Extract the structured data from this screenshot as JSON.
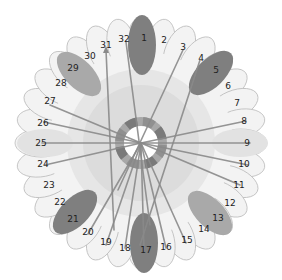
{
  "diagram": {
    "center": {
      "x": 141,
      "y": 143
    },
    "petal_count": 32,
    "petal_radius": 122,
    "colors": {
      "petal_fill": "#f3f3f3",
      "petal_stroke": "#bdbdbd",
      "inner_disk": "#dcdcdc",
      "mid_disk": "#e6e6e6",
      "ring_dark": "#7a7a7a",
      "ring_light": "#a8a8a8",
      "core": "#ffffff",
      "spoke": "#8a8a8a",
      "oval_dark": "#7f7f7f",
      "oval_medium": "#a9a9a9",
      "oval_light": "#e2e2e2"
    },
    "labels": [
      {
        "n": "1",
        "x": 144,
        "y": 38
      },
      {
        "n": "2",
        "x": 164,
        "y": 40
      },
      {
        "n": "3",
        "x": 183,
        "y": 47
      },
      {
        "n": "4",
        "x": 201,
        "y": 58
      },
      {
        "n": "5",
        "x": 216,
        "y": 70
      },
      {
        "n": "6",
        "x": 228,
        "y": 86
      },
      {
        "n": "7",
        "x": 237,
        "y": 103
      },
      {
        "n": "8",
        "x": 244,
        "y": 121
      },
      {
        "n": "9",
        "x": 247,
        "y": 143
      },
      {
        "n": "10",
        "x": 244,
        "y": 164
      },
      {
        "n": "11",
        "x": 239,
        "y": 185
      },
      {
        "n": "12",
        "x": 230,
        "y": 203
      },
      {
        "n": "13",
        "x": 218,
        "y": 218
      },
      {
        "n": "14",
        "x": 204,
        "y": 229
      },
      {
        "n": "15",
        "x": 187,
        "y": 240
      },
      {
        "n": "16",
        "x": 166,
        "y": 247
      },
      {
        "n": "17",
        "x": 146,
        "y": 250
      },
      {
        "n": "18",
        "x": 125,
        "y": 248
      },
      {
        "n": "19",
        "x": 106,
        "y": 242
      },
      {
        "n": "20",
        "x": 88,
        "y": 232
      },
      {
        "n": "21",
        "x": 73,
        "y": 219
      },
      {
        "n": "22",
        "x": 60,
        "y": 202
      },
      {
        "n": "23",
        "x": 49,
        "y": 185
      },
      {
        "n": "24",
        "x": 43,
        "y": 164
      },
      {
        "n": "25",
        "x": 41,
        "y": 143
      },
      {
        "n": "26",
        "x": 43,
        "y": 123
      },
      {
        "n": "27",
        "x": 50,
        "y": 101
      },
      {
        "n": "28",
        "x": 61,
        "y": 83
      },
      {
        "n": "29",
        "x": 73,
        "y": 68
      },
      {
        "n": "30",
        "x": 90,
        "y": 56
      },
      {
        "n": "31",
        "x": 106,
        "y": 45
      },
      {
        "n": "32",
        "x": 124,
        "y": 39
      }
    ],
    "ovals": [
      {
        "petal": "1",
        "cx": 142,
        "cy": 45,
        "rx": 14,
        "ry": 30,
        "angle": 0,
        "tone": "oval_dark"
      },
      {
        "petal": "5",
        "cx": 211,
        "cy": 73,
        "rx": 14,
        "ry": 28,
        "angle": 45,
        "tone": "oval_dark"
      },
      {
        "petal": "9",
        "cx": 240,
        "cy": 143,
        "rx": 14,
        "ry": 28,
        "angle": 90,
        "tone": "oval_light"
      },
      {
        "petal": "13",
        "cx": 210,
        "cy": 213,
        "rx": 14,
        "ry": 28,
        "angle": 135,
        "tone": "oval_medium"
      },
      {
        "petal": "17",
        "cx": 144,
        "cy": 243,
        "rx": 14,
        "ry": 30,
        "angle": 0,
        "tone": "oval_dark"
      },
      {
        "petal": "21",
        "cx": 75,
        "cy": 212,
        "rx": 14,
        "ry": 28,
        "angle": 45,
        "tone": "oval_dark"
      },
      {
        "petal": "25",
        "cx": 45,
        "cy": 143,
        "rx": 14,
        "ry": 28,
        "angle": 90,
        "tone": "oval_light"
      },
      {
        "petal": "29",
        "cx": 79,
        "cy": 74,
        "rx": 14,
        "ry": 28,
        "angle": 135,
        "tone": "oval_medium"
      }
    ],
    "spokes": [
      {
        "to": "31",
        "x1": 114,
        "y1": 230,
        "x2": 106,
        "y2": 50,
        "arrow": true
      },
      {
        "to": "32",
        "x1": 150,
        "y1": 225,
        "x2": 126,
        "y2": 42
      },
      {
        "to": "3",
        "x1": 118,
        "y1": 190,
        "x2": 183,
        "y2": 50
      },
      {
        "to": "4",
        "x1": 140,
        "y1": 245,
        "x2": 200,
        "y2": 60
      },
      {
        "to": "8",
        "x1": 141,
        "y1": 143,
        "x2": 246,
        "y2": 121
      },
      {
        "to": "9",
        "x1": 141,
        "y1": 143,
        "x2": 250,
        "y2": 143
      },
      {
        "to": "10",
        "x1": 141,
        "y1": 143,
        "x2": 248,
        "y2": 165
      },
      {
        "to": "11",
        "x1": 141,
        "y1": 143,
        "x2": 240,
        "y2": 185
      },
      {
        "to": "15",
        "x1": 141,
        "y1": 143,
        "x2": 186,
        "y2": 243
      },
      {
        "to": "16",
        "x1": 141,
        "y1": 143,
        "x2": 166,
        "y2": 248
      },
      {
        "to": "17",
        "x1": 141,
        "y1": 143,
        "x2": 144,
        "y2": 250
      },
      {
        "to": "18",
        "x1": 141,
        "y1": 143,
        "x2": 125,
        "y2": 248
      },
      {
        "to": "19",
        "x1": 141,
        "y1": 143,
        "x2": 106,
        "y2": 245
      },
      {
        "to": "20",
        "x1": 141,
        "y1": 143,
        "x2": 88,
        "y2": 234
      },
      {
        "to": "24",
        "x1": 141,
        "y1": 143,
        "x2": 45,
        "y2": 165
      },
      {
        "to": "25",
        "x1": 141,
        "y1": 143,
        "x2": 42,
        "y2": 143
      },
      {
        "to": "26",
        "x1": 141,
        "y1": 143,
        "x2": 44,
        "y2": 122
      },
      {
        "to": "27",
        "x1": 141,
        "y1": 143,
        "x2": 50,
        "y2": 105
      }
    ]
  }
}
